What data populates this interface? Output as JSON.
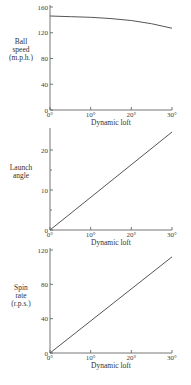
{
  "chart_data": [
    {
      "type": "line",
      "title": "",
      "xlabel": "Dynamic loft",
      "ylabel": [
        "Ball",
        "speed",
        "(m.p.h.)"
      ],
      "x": [
        0,
        5,
        10,
        15,
        20,
        25,
        30
      ],
      "x_tick_labels": [
        "0°",
        "10°",
        "20°",
        "30°"
      ],
      "y_ticks": [
        0,
        40,
        80,
        120,
        160
      ],
      "ylim": [
        0,
        160
      ],
      "xlim": [
        0,
        30
      ],
      "series": [
        {
          "name": "Ball speed",
          "values": [
            146,
            145,
            144,
            142,
            139,
            134,
            127
          ]
        }
      ],
      "grid": false
    },
    {
      "type": "line",
      "title": "",
      "xlabel": "Dynamic loft",
      "ylabel": [
        "Launch",
        "angle"
      ],
      "x": [
        0,
        30
      ],
      "x_tick_labels": [
        "0°",
        "10°",
        "20°",
        "30°"
      ],
      "y_ticks": [
        0,
        10,
        20
      ],
      "ylim": [
        0,
        25
      ],
      "xlim": [
        0,
        30
      ],
      "series": [
        {
          "name": "Launch angle",
          "values": [
            0,
            24.5
          ]
        }
      ],
      "grid": false
    },
    {
      "type": "line",
      "title": "",
      "xlabel": "Dynamic loft",
      "ylabel": [
        "Spin",
        "rate",
        "(r.p.s.)"
      ],
      "x": [
        0,
        30
      ],
      "x_tick_labels": [
        "0°",
        "10°",
        "20°",
        "30°"
      ],
      "y_ticks": [
        0,
        40,
        80,
        120
      ],
      "ylim": [
        0,
        120
      ],
      "xlim": [
        0,
        30
      ],
      "series": [
        {
          "name": "Spin rate",
          "values": [
            0,
            112
          ]
        }
      ],
      "grid": false
    }
  ]
}
